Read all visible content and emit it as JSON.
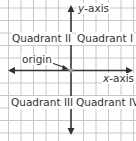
{
  "diagram": {
    "type": "coordinate-plane",
    "axes": {
      "x_label_var": "x",
      "x_label_rest": "-axis",
      "y_label_var": "y",
      "y_label_rest": "-axis"
    },
    "quadrants": {
      "q1": "Quadrant I",
      "q2": "Quadrant II",
      "q3": "Quadrant III",
      "q4": "Quadrant IV"
    },
    "origin_label": "origin",
    "colors": {
      "grid": "#c8c8c8",
      "axis": "#333333",
      "origin_point": "#999999",
      "text": "#333333"
    }
  }
}
